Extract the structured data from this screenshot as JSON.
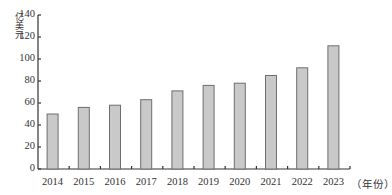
{
  "chart_data": {
    "type": "bar",
    "title": "",
    "xlabel": "（年份）",
    "ylabel": "亿美元",
    "categories": [
      "2014",
      "2015",
      "2016",
      "2017",
      "2018",
      "2019",
      "2020",
      "2021",
      "2022",
      "2023"
    ],
    "values": [
      50,
      56,
      58,
      63,
      71,
      76,
      78,
      85,
      92,
      112
    ],
    "ylim": [
      0,
      140
    ],
    "yticks": [
      0,
      20,
      40,
      60,
      80,
      100,
      120,
      140
    ],
    "grid": false,
    "legend": null,
    "colors": {
      "bar_fill": "#c9c9c9",
      "bar_stroke": "#6e6e6e",
      "axis": "#333333"
    }
  },
  "axis": {
    "y_unit": "亿美元",
    "x_unit": "（年份）",
    "y_tick_labels": [
      "0",
      "20",
      "40",
      "60",
      "80",
      "100",
      "120",
      "140"
    ],
    "x_tick_labels": [
      "2014",
      "2015",
      "2016",
      "2017",
      "2018",
      "2019",
      "2020",
      "2021",
      "2022",
      "2023"
    ]
  }
}
